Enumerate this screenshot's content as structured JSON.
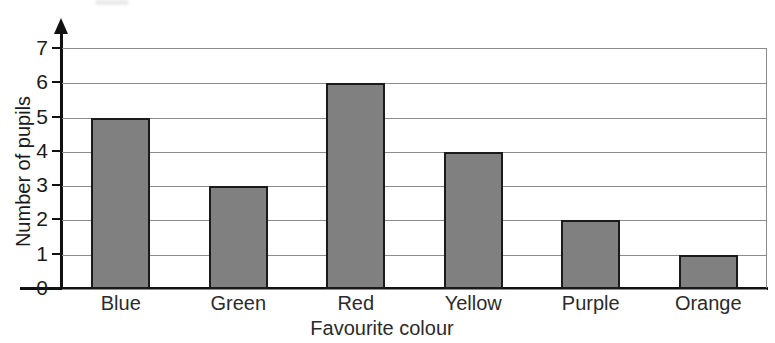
{
  "chart_data": {
    "type": "bar",
    "title": "",
    "xlabel": "Favourite colour",
    "ylabel": "Number of pupils",
    "categories": [
      "Blue",
      "Green",
      "Red",
      "Yellow",
      "Purple",
      "Orange"
    ],
    "values": [
      5,
      3,
      6,
      4,
      2,
      1
    ],
    "ylim": [
      0,
      7
    ],
    "ytick_labels": [
      "0",
      "1",
      "2",
      "3",
      "4",
      "5",
      "6",
      "7"
    ],
    "ytick_values": [
      0,
      1,
      2,
      3,
      4,
      5,
      6,
      7
    ],
    "grid": "horizontal",
    "legend": "none",
    "bar_color": "#808080",
    "bar_edge_color": "#1a1a1a",
    "gridline_color": "#8b8b8b",
    "axis_color": "#111111"
  }
}
